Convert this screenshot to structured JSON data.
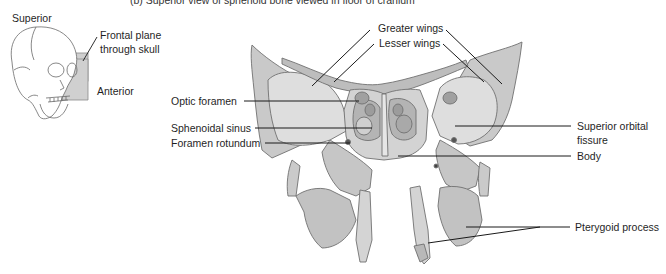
{
  "figure": {
    "title": "(b) Superior view of sphenoid bone viewed in floor of cranium"
  },
  "inset": {
    "orientation_top": "Superior",
    "plane_label_line1": "Frontal plane",
    "plane_label_line2": "through skull",
    "orientation_side": "Anterior"
  },
  "labels": {
    "greater_wings": "Greater wings",
    "lesser_wings": "Lesser wings",
    "optic_foramen": "Optic foramen",
    "sphenoidal_sinus": "Sphenoidal sinus",
    "foramen_rotundum": "Foramen rotundum",
    "superior_orbital_fissure_line1": "Superior orbital",
    "superior_orbital_fissure_line2": "fissure",
    "body": "Body",
    "pterygoid_process": "Pterygoid process"
  },
  "colors": {
    "bone_fill": "#d6d6d6",
    "bone_shadow": "#a8a8a8",
    "bone_light": "#e8e8e8",
    "outline": "#6e6e6e",
    "leader_line": "#1a1a1a",
    "plane_fill": "#c8c8c8"
  }
}
